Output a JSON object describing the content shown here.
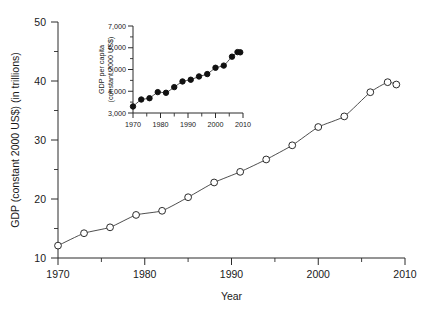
{
  "chart_data": [
    {
      "id": "main",
      "type": "line",
      "title": "",
      "xlabel": "Year",
      "ylabel": "GDP (constant 2000 US$) (in trillions)",
      "xlim": [
        1970,
        2010
      ],
      "ylim": [
        10,
        50
      ],
      "xticks": [
        1970,
        1980,
        1990,
        2000,
        2010
      ],
      "xtick_labels": [
        "1970",
        "1980",
        "1990",
        "2000",
        "2010"
      ],
      "xminor_ticks": [
        1975,
        1985,
        1995,
        2005
      ],
      "yticks": [
        10,
        20,
        30,
        40,
        50
      ],
      "ytick_labels": [
        "10",
        "20",
        "30",
        "40",
        "50"
      ],
      "yminor_ticks": [
        15,
        25,
        35,
        45
      ],
      "grid": false,
      "legend": "none",
      "marker": "open-circle",
      "x": [
        1970,
        1973,
        1976,
        1979,
        1982,
        1985,
        1988,
        1991,
        1994,
        1997,
        2000,
        2003,
        2006,
        2008,
        2009
      ],
      "values": [
        12.1,
        14.2,
        15.2,
        17.3,
        18.0,
        20.3,
        22.8,
        24.6,
        26.7,
        29.1,
        32.2,
        34.0,
        38.1,
        39.8,
        39.4
      ]
    },
    {
      "id": "inset",
      "type": "scatter",
      "title": "",
      "xlabel": "",
      "ylabel": "GDP per capita (constant 2000 US$)",
      "xlim": [
        1970,
        2010
      ],
      "ylim": [
        3000,
        7000
      ],
      "xticks": [
        1970,
        1980,
        1990,
        2000,
        2010
      ],
      "xtick_labels": [
        "1970",
        "1980",
        "1990",
        "2000",
        "2010"
      ],
      "xminor_ticks": [
        1975,
        1985,
        1995,
        2005
      ],
      "yticks": [
        3000,
        4000,
        5000,
        6000,
        7000
      ],
      "ytick_labels": [
        "3,000",
        "4,000",
        "5,000",
        "6,000",
        "7,000"
      ],
      "yminor_ticks": [
        3500,
        4500,
        5500,
        6500
      ],
      "grid": false,
      "legend": "none",
      "marker": "filled-circle",
      "x": [
        1970,
        1973,
        1976,
        1979,
        1982,
        1985,
        1988,
        1991,
        1994,
        1997,
        2000,
        2003,
        2006,
        2008,
        2009
      ],
      "values": [
        3300,
        3620,
        3680,
        3960,
        3930,
        4190,
        4450,
        4530,
        4680,
        4790,
        5080,
        5180,
        5590,
        5800,
        5790
      ]
    }
  ],
  "figure": {
    "background_color": "#ffffff",
    "line_color": "#3a3a3a",
    "axis_color": "#2b2b2b",
    "text_color": "#1a1a1a"
  },
  "main_axis": {
    "ylabel": "GDP (constant 2000 US$) (in trillions)",
    "xlabel": "Year",
    "ytick_labels": [
      "50",
      "40",
      "30",
      "20",
      "10"
    ],
    "xtick_labels": [
      "1970",
      "1980",
      "1990",
      "2000",
      "2010"
    ]
  },
  "inset_axis": {
    "ylabel_line1": "GDP per capita",
    "ylabel_line2": "(constant 2000 US$)",
    "ytick_labels": [
      "7,000",
      "6,000",
      "5,000",
      "4,000",
      "3,000"
    ],
    "xtick_labels": [
      "1970",
      "1980",
      "1990",
      "2000",
      "2010"
    ]
  }
}
